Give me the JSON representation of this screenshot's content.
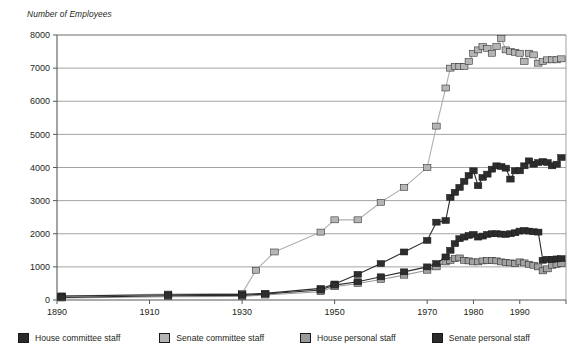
{
  "chart_data": {
    "type": "line",
    "title": "",
    "ylabel": "Number of Employees",
    "xlabel": "",
    "ylim": [
      0,
      8000
    ],
    "xlim": [
      1890,
      2000
    ],
    "grid": "horizontal",
    "legend_position": "bottom",
    "yticks": [
      0,
      1000,
      2000,
      3000,
      4000,
      5000,
      6000,
      7000,
      8000
    ],
    "xticks": [
      1890,
      1910,
      1930,
      1950,
      1970,
      1980,
      1990
    ],
    "colors": {
      "house_committee": "#2b2b2b",
      "senate_committee": "#b3b3b3",
      "house_personal": "#9a9a9a",
      "senate_personal": "#2b2b2b",
      "gridline": "#8c8c8c",
      "axis": "#58585b",
      "text": "#231f20"
    },
    "series": [
      {
        "name": "House committee staff",
        "color": "#2b2b2b",
        "marker": "square",
        "x": [
          1891,
          1914,
          1930,
          1935,
          1947,
          1950,
          1955,
          1960,
          1965,
          1970,
          1973,
          1975,
          1976,
          1977,
          1978,
          1979,
          1980,
          1981,
          1982,
          1983,
          1984,
          1985,
          1986,
          1987,
          1988,
          1989,
          1990,
          1991,
          1992,
          1993,
          1994,
          1995,
          1996,
          1997,
          1998,
          1999,
          2000
        ],
        "values": [
          62,
          105,
          112,
          122,
          193,
          246,
          329,
          440,
          571,
          702,
          878,
          1433,
          1680,
          1776,
          1844,
          1909,
          1917,
          1843,
          1973,
          2068,
          2146,
          2009,
          2024,
          2024,
          2008,
          2055,
          2100,
          2021,
          2046,
          1980,
          1700,
          1800,
          1850,
          1900,
          1950,
          2000,
          2100
        ],
        "values_note": "see house_committee_actual"
      }
    ],
    "series_data": {
      "house_committee": {
        "label": "House committee staff",
        "color": "#2b2b2b",
        "points": [
          [
            1891,
            62
          ],
          [
            1914,
            105
          ],
          [
            1930,
            112
          ],
          [
            1935,
            122
          ],
          [
            1947,
            193
          ],
          [
            1950,
            246
          ],
          [
            1955,
            329
          ],
          [
            1960,
            440
          ],
          [
            1965,
            571
          ],
          [
            1970,
            702
          ],
          [
            1972,
            817
          ],
          [
            1974,
            1107
          ],
          [
            1975,
            1460
          ],
          [
            1976,
            1680
          ],
          [
            1977,
            1776
          ],
          [
            1978,
            1844
          ],
          [
            1979,
            1909
          ],
          [
            1980,
            1917
          ],
          [
            1981,
            1843
          ],
          [
            1982,
            1973
          ],
          [
            1983,
            2068
          ],
          [
            1984,
            2146
          ],
          [
            1985,
            2009
          ],
          [
            1986,
            2146
          ],
          [
            1987,
            2024
          ],
          [
            1988,
            2008
          ],
          [
            1989,
            2055
          ],
          [
            1990,
            2100
          ],
          [
            1991,
            2021
          ],
          [
            1992,
            2046
          ],
          [
            1993,
            1980
          ],
          [
            1994,
            2046
          ],
          [
            1995,
            1200
          ],
          [
            1996,
            1250
          ],
          [
            1997,
            1276
          ],
          [
            1998,
            1305
          ],
          [
            1999,
            1267
          ]
        ]
      }
    },
    "senate_committee_points": [
      [
        1891,
        41
      ],
      [
        1914,
        198
      ],
      [
        1930,
        163
      ],
      [
        1935,
        172
      ],
      [
        1947,
        232
      ],
      [
        1950,
        300
      ],
      [
        1955,
        386
      ],
      [
        1960,
        470
      ],
      [
        1965,
        509
      ],
      [
        1970,
        635
      ],
      [
        1972,
        918
      ],
      [
        1974,
        1107
      ],
      [
        1975,
        1277
      ],
      [
        1976,
        1201
      ],
      [
        1977,
        1028
      ],
      [
        1978,
        1151
      ],
      [
        1979,
        1269
      ],
      [
        1980,
        1191
      ],
      [
        1981,
        1150
      ],
      [
        1982,
        1176
      ],
      [
        1983,
        1176
      ],
      [
        1984,
        1178
      ],
      [
        1985,
        1178
      ],
      [
        1986,
        1075
      ],
      [
        1987,
        1074
      ],
      [
        1988,
        1013
      ],
      [
        1989,
        1013
      ],
      [
        1990,
        1090
      ],
      [
        1991,
        1030
      ],
      [
        1992,
        1008
      ],
      [
        1993,
        1000
      ],
      [
        1994,
        958
      ],
      [
        1995,
        732
      ],
      [
        1996,
        780
      ],
      [
        1997,
        1100
      ],
      [
        1998,
        1100
      ],
      [
        1999,
        1090
      ]
    ],
    "points": {
      "house_committee_staff": {
        "label": "House committee staff",
        "color": "#2b2b2b",
        "fill": "#2b2b2b",
        "data": [
          [
            1891,
            62
          ],
          [
            1914,
            100
          ],
          [
            1930,
            112
          ],
          [
            1935,
            122
          ],
          [
            1947,
            182
          ],
          [
            1950,
            246
          ],
          [
            1955,
            329
          ],
          [
            1960,
            440
          ],
          [
            1965,
            571
          ],
          [
            1970,
            702
          ],
          [
            1972,
            817
          ],
          [
            1974,
            1107
          ],
          [
            1975,
            1460
          ],
          [
            1976,
            1680
          ],
          [
            1977,
            1776
          ],
          [
            1979,
            1909
          ],
          [
            1981,
            1843
          ],
          [
            1983,
            2068
          ],
          [
            1985,
            2146
          ],
          [
            1987,
            2024
          ],
          [
            1989,
            2055
          ],
          [
            1991,
            2100
          ],
          [
            1993,
            2046
          ],
          [
            1995,
            1200
          ],
          [
            1997,
            1250
          ],
          [
            1999,
            1267
          ]
        ]
      }
    },
    "series_list": [
      {
        "key": "house_committee",
        "label": "House committee staff",
        "color": "#2b2b2b",
        "marker_fill": "#2b2b2b",
        "marker_stroke": "#000000",
        "data": [
          [
            1891,
            62
          ],
          [
            1914,
            114
          ],
          [
            1930,
            112
          ],
          [
            1935,
            122
          ],
          [
            1947,
            193
          ],
          [
            1950,
            246
          ],
          [
            1955,
            386
          ],
          [
            1960,
            440
          ],
          [
            1965,
            571
          ],
          [
            1970,
            702
          ],
          [
            1972,
            817
          ],
          [
            1974,
            1107
          ],
          [
            1975,
            1460
          ],
          [
            1976,
            1680
          ],
          [
            1977,
            1776
          ],
          [
            1979,
            1909
          ],
          [
            1981,
            1843
          ],
          [
            1983,
            2068
          ],
          [
            1985,
            2146
          ],
          [
            1987,
            2024
          ],
          [
            1989,
            2055
          ],
          [
            1991,
            2100
          ],
          [
            1993,
            2046
          ],
          [
            1995,
            1200
          ],
          [
            1997,
            1250
          ],
          [
            1999,
            1267
          ]
        ]
      }
    ],
    "plot": {
      "house_committee": {
        "label": "House committee staff",
        "color": "#2b2b2b",
        "marker": "#2d2d2d",
        "xy": [
          [
            1891,
            120
          ],
          [
            1914,
            160
          ],
          [
            1930,
            170
          ],
          [
            1935,
            200
          ],
          [
            1947,
            350
          ],
          [
            1950,
            483
          ],
          [
            1955,
            775
          ],
          [
            1960,
            1100
          ],
          [
            1965,
            1450
          ],
          [
            1970,
            1800
          ],
          [
            1972,
            2350
          ],
          [
            1974,
            2400
          ],
          [
            1975,
            3100
          ],
          [
            1976,
            3250
          ],
          [
            1977,
            3400
          ],
          [
            1978,
            3580
          ],
          [
            1979,
            3760
          ],
          [
            1980,
            3900
          ],
          [
            1981,
            3450
          ],
          [
            1982,
            3700
          ],
          [
            1983,
            3800
          ],
          [
            1984,
            3950
          ],
          [
            1985,
            4050
          ],
          [
            1986,
            4030
          ],
          [
            1987,
            3980
          ],
          [
            1988,
            3650
          ],
          [
            1989,
            3900
          ],
          [
            1990,
            3900
          ],
          [
            1991,
            4050
          ],
          [
            1992,
            4200
          ],
          [
            1993,
            4100
          ],
          [
            1994,
            4150
          ],
          [
            1995,
            4180
          ],
          [
            1996,
            4150
          ],
          [
            1997,
            4050
          ],
          [
            1998,
            4100
          ],
          [
            1999,
            4300
          ]
        ]
      },
      "senate_committee": {
        "label": "Senate committee staff",
        "color": "#b0b0b0",
        "marker": "#b5b5b5",
        "xy": [
          [
            1891,
            120
          ],
          [
            1914,
            180
          ],
          [
            1930,
            200
          ],
          [
            1933,
            900
          ],
          [
            1937,
            1450
          ],
          [
            1947,
            2050
          ],
          [
            1950,
            2420
          ],
          [
            1955,
            2420
          ],
          [
            1960,
            2950
          ],
          [
            1965,
            3400
          ],
          [
            1970,
            4000
          ],
          [
            1972,
            5250
          ],
          [
            1974,
            6400
          ],
          [
            1975,
            7000
          ],
          [
            1976,
            7050
          ],
          [
            1977,
            7050
          ],
          [
            1978,
            7050
          ],
          [
            1979,
            7200
          ],
          [
            1980,
            7450
          ],
          [
            1981,
            7550
          ],
          [
            1982,
            7650
          ],
          [
            1983,
            7600
          ],
          [
            1984,
            7450
          ],
          [
            1985,
            7650
          ],
          [
            1986,
            7900
          ],
          [
            1987,
            7550
          ],
          [
            1988,
            7500
          ],
          [
            1989,
            7480
          ],
          [
            1990,
            7450
          ],
          [
            1991,
            7200
          ],
          [
            1992,
            7450
          ],
          [
            1993,
            7400
          ],
          [
            1994,
            7150
          ],
          [
            1995,
            7200
          ],
          [
            1996,
            7250
          ],
          [
            1997,
            7250
          ],
          [
            1998,
            7250
          ],
          [
            1999,
            7280
          ]
        ]
      },
      "house_personal": {
        "label": "House personal staff",
        "color": "#9a9a9a",
        "marker": "#a2a2a2",
        "xy": [
          [
            1891,
            60
          ],
          [
            1914,
            100
          ],
          [
            1930,
            110
          ],
          [
            1935,
            150
          ],
          [
            1947,
            250
          ],
          [
            1950,
            400
          ],
          [
            1955,
            500
          ],
          [
            1960,
            620
          ],
          [
            1965,
            750
          ],
          [
            1970,
            900
          ],
          [
            1972,
            1000
          ],
          [
            1974,
            1150
          ],
          [
            1975,
            1200
          ],
          [
            1976,
            1250
          ],
          [
            1977,
            1270
          ],
          [
            1978,
            1200
          ],
          [
            1979,
            1180
          ],
          [
            1980,
            1150
          ],
          [
            1981,
            1150
          ],
          [
            1982,
            1180
          ],
          [
            1983,
            1190
          ],
          [
            1984,
            1200
          ],
          [
            1985,
            1180
          ],
          [
            1986,
            1150
          ],
          [
            1987,
            1130
          ],
          [
            1988,
            1120
          ],
          [
            1989,
            1100
          ],
          [
            1990,
            1150
          ],
          [
            1991,
            1120
          ],
          [
            1992,
            1080
          ],
          [
            1993,
            1050
          ],
          [
            1994,
            1000
          ],
          [
            1995,
            880
          ],
          [
            1996,
            940
          ],
          [
            1997,
            1050
          ],
          [
            1998,
            1080
          ],
          [
            1999,
            1100
          ]
        ]
      },
      "senate_personal": {
        "label": "Senate personal staff",
        "color": "#2b2b2b",
        "marker": "#2d2d2d",
        "xy": [
          [
            1891,
            80
          ],
          [
            1914,
            130
          ],
          [
            1930,
            140
          ],
          [
            1935,
            180
          ],
          [
            1947,
            300
          ],
          [
            1950,
            450
          ],
          [
            1955,
            550
          ],
          [
            1960,
            700
          ],
          [
            1965,
            850
          ],
          [
            1970,
            1000
          ],
          [
            1972,
            1100
          ],
          [
            1974,
            1300
          ],
          [
            1975,
            1500
          ],
          [
            1976,
            1700
          ],
          [
            1977,
            1850
          ],
          [
            1978,
            1900
          ],
          [
            1979,
            1950
          ],
          [
            1980,
            1980
          ],
          [
            1981,
            1900
          ],
          [
            1982,
            1930
          ],
          [
            1983,
            1980
          ],
          [
            1984,
            2000
          ],
          [
            1985,
            2000
          ],
          [
            1986,
            1990
          ],
          [
            1987,
            1980
          ],
          [
            1988,
            2000
          ],
          [
            1989,
            2030
          ],
          [
            1990,
            2080
          ],
          [
            1991,
            2100
          ],
          [
            1992,
            2080
          ],
          [
            1993,
            2060
          ],
          [
            1994,
            2050
          ],
          [
            1995,
            1200
          ],
          [
            1996,
            1230
          ],
          [
            1997,
            1230
          ],
          [
            1998,
            1240
          ],
          [
            1999,
            1250
          ]
        ]
      }
    }
  },
  "legend": {
    "items": [
      {
        "label": "House committee staff",
        "color": "#2b2b2b"
      },
      {
        "label": "Senate committee staff",
        "color": "#b3b3b3"
      },
      {
        "label": "House personal staff",
        "color": "#9a9a9a"
      },
      {
        "label": "Senate personal staff",
        "color": "#2b2b2b"
      }
    ]
  },
  "axes": {
    "y_title": "Number of Employees",
    "y_labels": [
      "8000",
      "7000",
      "6000",
      "5000",
      "4000",
      "3000",
      "2000",
      "1000",
      "0"
    ],
    "x_labels": [
      "1890",
      "1910",
      "1930",
      "1950",
      "1970",
      "1980",
      "1990"
    ]
  }
}
